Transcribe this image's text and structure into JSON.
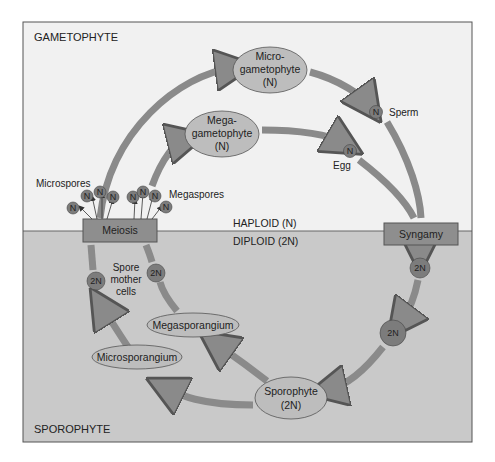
{
  "regions": {
    "top_label": "GAMETOPHYTE",
    "bottom_label": "SPOROPHYTE",
    "haploid_label": "HAPLOID (N)",
    "diploid_label": "DIPLOID (2N)"
  },
  "processes": {
    "meiosis": "Meiosis",
    "syngamy": "Syngamy"
  },
  "nodes": {
    "microgametophyte": {
      "line1": "Micro-",
      "line2": "gametophyte",
      "line3": "(N)"
    },
    "megagametophyte": {
      "line1": "Mega-",
      "line2": "gametophyte",
      "line3": "(N)"
    },
    "sporophyte": {
      "line1": "Sporophyte",
      "line2": "(2N)"
    },
    "megasporangium": "Megasporangium",
    "microsporangium": "Microsporangium"
  },
  "cells": {
    "sperm_label": "Sperm",
    "egg_label": "Egg",
    "haploid_symbol": "N",
    "diploid_symbol": "2N",
    "microspores_label": "Microspores",
    "megaspores_label": "Megaspores",
    "spore_mother_cells": {
      "line1": "Spore",
      "line2": "mother",
      "line3": "cells"
    }
  },
  "colors": {
    "gametophyte_bg": "#f1f1f1",
    "sporophyte_bg": "#c9c9c9",
    "arrow_fill": "#8a8a8a",
    "ellipse_fill": "#bdbdbd",
    "box_fill": "#8e8e8e",
    "circle_fill": "#7c7c7c",
    "border": "#555555"
  }
}
